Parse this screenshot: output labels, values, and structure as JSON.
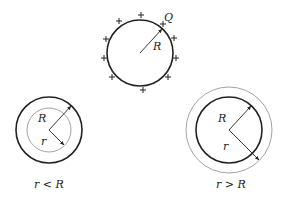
{
  "diagram": {
    "top": {
      "charge_label": "Q",
      "radius_label": "R",
      "plus_symbol": "+",
      "center": [
        140,
        53
      ],
      "radius": 32,
      "plus_positions": [
        [
          141,
          15
        ],
        [
          119,
          21
        ],
        [
          106,
          39
        ],
        [
          104,
          58
        ],
        [
          112,
          77
        ],
        [
          143,
          90
        ],
        [
          168,
          77
        ],
        [
          176,
          58
        ],
        [
          174,
          38
        ],
        [
          163,
          24
        ]
      ]
    },
    "left": {
      "radius_label": "R",
      "gaussian_label": "r",
      "caption": "r < R",
      "center": [
        49,
        130
      ],
      "shell_radius": 33,
      "gaussian_radius": 22
    },
    "right": {
      "radius_label": "R",
      "gaussian_label": "r",
      "caption": "r > R",
      "center": [
        229,
        130
      ],
      "shell_radius": 33,
      "gaussian_radius": 43
    },
    "colors": {
      "shell": "#222222",
      "gaussian": "#999999",
      "text": "#222222"
    }
  }
}
